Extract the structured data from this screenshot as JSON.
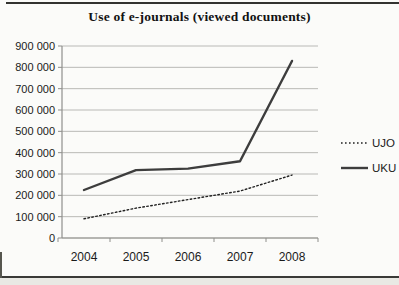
{
  "page": {
    "title": "Use of e-journals (viewed documents)"
  },
  "chart_data": {
    "type": "line",
    "title": "Use of e-journals (viewed documents)",
    "categories": [
      "2004",
      "2005",
      "2006",
      "2007",
      "2008"
    ],
    "series": [
      {
        "name": "UJO",
        "style": "dotted",
        "color": "#222222",
        "values": [
          90000,
          140000,
          180000,
          220000,
          295000
        ]
      },
      {
        "name": "UKU",
        "style": "solid",
        "color": "#3d3d3d",
        "values": [
          225000,
          318000,
          325000,
          360000,
          830000
        ]
      }
    ],
    "ylim": [
      0,
      900000
    ],
    "ytick_step": 100000,
    "ytick_labels": [
      "0",
      "100 000",
      "200 000",
      "300 000",
      "400 000",
      "500 000",
      "600 000",
      "700 000",
      "800 000",
      "900 000"
    ],
    "xlabel": "",
    "ylabel": "",
    "grid": true,
    "legend_position": "right",
    "gridline_color": "#b9b9b6",
    "axis_color": "#8f8f8c",
    "text_color": "#1a1a1a"
  }
}
